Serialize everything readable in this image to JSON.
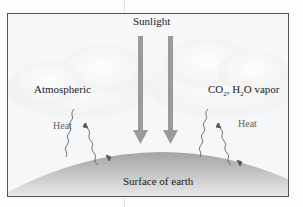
{
  "diagram": {
    "title_label": "Sunlight",
    "left_label": "Atmospheric",
    "right_label_html_parts": {
      "co": "CO",
      "co_sub": "2",
      "sep": ", H",
      "h_sub": "2",
      "rest": "O vapor"
    },
    "heat_left": "Heat",
    "heat_right": "Heat",
    "surface_label": "Surface of earth",
    "colors": {
      "arrow": "#9a9a9a",
      "earth_top": "#9e9e9e",
      "earth_bottom": "#e4e4e4",
      "cloud": "#ffffff",
      "frame_border": "#555555"
    }
  }
}
